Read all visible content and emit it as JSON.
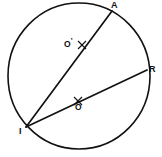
{
  "figure": {
    "type": "circle-with-chords",
    "background_color": "#ffffff",
    "stroke_color": "#111111",
    "canvas": {
      "width": 162,
      "height": 157
    }
  },
  "circle": {
    "name": "main-circle",
    "center_x": 79,
    "center_y": 76,
    "radius_x": 71,
    "radius_y": 73,
    "stroke_width": 1.6,
    "fill": "none"
  },
  "vertices": [
    {
      "id": "A",
      "label": "A",
      "x": 112,
      "y": 11,
      "label_x": 111,
      "label_y": 1
    },
    {
      "id": "R",
      "label": "R",
      "x": 147,
      "y": 70,
      "label_x": 149,
      "label_y": 66
    },
    {
      "id": "I",
      "label": "I",
      "x": 26,
      "y": 127,
      "label_x": 19,
      "label_y": 128
    }
  ],
  "chords": [
    {
      "id": "IA",
      "name": "chord-i-a",
      "from": "I",
      "to": "A",
      "x1": 26,
      "y1": 127,
      "x2": 112,
      "y2": 11,
      "stroke_width": 1.7
    },
    {
      "id": "IR",
      "name": "chord-i-r",
      "from": "I",
      "to": "R",
      "x1": 26,
      "y1": 127,
      "x2": 147,
      "y2": 70,
      "stroke_width": 1.7
    }
  ],
  "marked_points": [
    {
      "id": "Oprime",
      "label": "O",
      "prime": "'",
      "on_chord": "IA",
      "tick_x": 82,
      "tick_y": 45,
      "tick_size": 4,
      "label_x": 64,
      "label_y": 37
    },
    {
      "id": "O",
      "label": "O",
      "prime": "",
      "on_chord": "IR",
      "tick_x": 78,
      "tick_y": 101,
      "tick_size": 4,
      "label_x": 75,
      "label_y": 104
    }
  ]
}
